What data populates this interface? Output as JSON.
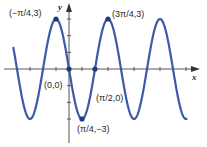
{
  "chart_data": {
    "type": "line",
    "title": "",
    "function": "y = -3 sin(2x)",
    "xlabel": "x",
    "ylabel": "y",
    "x_unit": "pi/4",
    "xlim": [
      -4.4,
      7.1
    ],
    "ylim": [
      -3.3,
      4.0
    ],
    "x_ticks_step": 0.7854,
    "y_ticks": [
      -3,
      -2,
      -1,
      1,
      2,
      3
    ],
    "grid": false,
    "legend": null,
    "series": [
      {
        "name": "y = -3 sin 2x",
        "color": "#3a5aa8",
        "x_range": [
          -3.36,
          7.1
        ]
      }
    ],
    "points": [
      {
        "x": -0.7854,
        "y": 3,
        "label": "(−π/4,3)"
      },
      {
        "x": 0,
        "y": 0,
        "label": "(0,0)"
      },
      {
        "x": 0.7854,
        "y": -3,
        "label": "(π/4,−3)"
      },
      {
        "x": 1.5708,
        "y": 0,
        "label": "(π/2,0)"
      },
      {
        "x": 2.3562,
        "y": 3,
        "label": "(3π/4,3)"
      }
    ],
    "annotations": [
      "(−π/4,3)",
      "(3π/4,3)",
      "(0,0)",
      "(π/2,0)",
      "(π/4,−3)"
    ]
  },
  "labels": {
    "x_axis": "x",
    "y_axis": "y",
    "peak_left": "(−π/4,3)",
    "peak_right": "(3π/4,3)",
    "origin": "(0,0)",
    "zero_right": "(π/2,0)",
    "trough": "(π/4,−3)"
  },
  "colors": {
    "curve": "#3a5aa8",
    "axis": "#555555",
    "point": "#1f3a78"
  }
}
